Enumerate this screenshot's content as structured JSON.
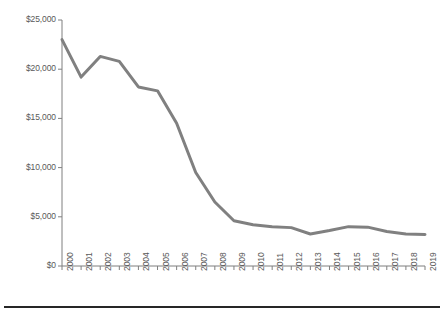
{
  "chart_data": {
    "type": "line",
    "title": "",
    "subtitle": "",
    "xlabel": "",
    "ylabel": "",
    "categories": [
      "2000",
      "2001",
      "2002",
      "2003",
      "2004",
      "2005",
      "2006",
      "2007",
      "2008",
      "2009",
      "2010",
      "2011",
      "2012",
      "2013",
      "2014",
      "2015",
      "2016",
      "2017",
      "2018",
      "2019"
    ],
    "series": [
      {
        "name": "",
        "color": "#808080",
        "values": [
          23000,
          19200,
          21300,
          20800,
          18200,
          17800,
          14500,
          9500,
          6500,
          4600,
          4200,
          4000,
          3900,
          3250,
          3600,
          4000,
          3950,
          3500,
          3250,
          3200
        ]
      }
    ],
    "ylim": [
      0,
      25000
    ],
    "yticks": [
      0,
      5000,
      10000,
      15000,
      20000,
      25000
    ],
    "ytick_labels": [
      "$0",
      "$5,000",
      "$10,000",
      "$15,000",
      "$20,000",
      "$25,000"
    ],
    "grid": false,
    "legend": false,
    "legend_position": "none",
    "axis_color": "#808080",
    "tick_label_color": "#595959",
    "line_width": 3,
    "background": "#ffffff"
  },
  "figure": {
    "bottom_rule_color": "#262626"
  }
}
